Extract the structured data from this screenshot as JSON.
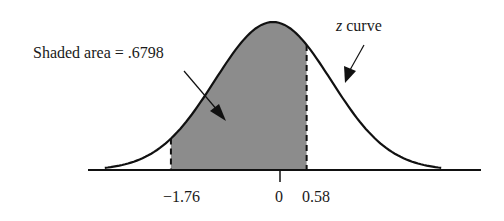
{
  "chart_data": {
    "type": "area",
    "title": "",
    "curve_label_var": "z",
    "curve_label_text": " curve",
    "annotation": "Shaded area = .6798",
    "shaded_area": 0.6798,
    "shaded_from": -1.76,
    "shaded_to": 0.58,
    "tick_labels": [
      "−1.76",
      "0",
      "0.58"
    ],
    "ticks": [
      -1.76,
      0,
      0.58
    ],
    "xlabel": "",
    "ylabel": "",
    "colors": {
      "shade": "#8c8c8c",
      "curve": "#111111"
    }
  }
}
